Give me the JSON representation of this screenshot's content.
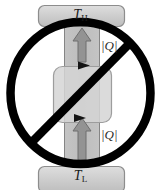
{
  "figure": {
    "hot_reservoir": {
      "label": "T",
      "subscript": "H",
      "name": "hot-reservoir"
    },
    "cold_reservoir": {
      "label": "T",
      "subscript": "L",
      "name": "cold-reservoir"
    },
    "heat_labels": [
      {
        "text": "|Q|",
        "position": "upper-right"
      },
      {
        "text": "|Q|",
        "position": "lower-right"
      }
    ],
    "arrows": {
      "upper_heat_arrow": "arrow-up",
      "lower_heat_arrow": "arrow-up",
      "upper_flow_marker": "arrowhead-right",
      "lower_flow_marker": "arrowhead-right"
    },
    "prohibition": {
      "symbol": "no-entry-slash",
      "meaning": "not-possible"
    },
    "colors": {
      "reservoir_fill": "#c9c9c9",
      "reservoir_stroke": "#8a8a8a",
      "band_fill": "#bfbfbf",
      "band_stroke": "#7a7a7a",
      "engine_fill": "#d7d7d7",
      "engine_stroke": "#9a9a9a",
      "arrow_fill": "#8f8f8f",
      "arrow_stroke": "#6a6a6a",
      "prohibition_stroke": "#000000",
      "text": "#1a1a1a"
    }
  }
}
